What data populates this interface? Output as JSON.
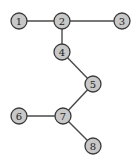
{
  "diagram": {
    "type": "tree-graph",
    "nodes": [
      {
        "id": "1",
        "label": "1",
        "x": 19,
        "y": 21
      },
      {
        "id": "2",
        "label": "2",
        "x": 62,
        "y": 21
      },
      {
        "id": "3",
        "label": "3",
        "x": 122,
        "y": 21
      },
      {
        "id": "4",
        "label": "4",
        "x": 62,
        "y": 52
      },
      {
        "id": "5",
        "label": "5",
        "x": 93,
        "y": 84
      },
      {
        "id": "6",
        "label": "6",
        "x": 19,
        "y": 116
      },
      {
        "id": "7",
        "label": "7",
        "x": 63,
        "y": 116
      },
      {
        "id": "8",
        "label": "8",
        "x": 93,
        "y": 146
      }
    ],
    "edges": [
      [
        "1",
        "2"
      ],
      [
        "2",
        "3"
      ],
      [
        "2",
        "4"
      ],
      [
        "4",
        "5"
      ],
      [
        "5",
        "7"
      ],
      [
        "6",
        "7"
      ],
      [
        "7",
        "8"
      ]
    ],
    "colors": {
      "node_fill": "#c8c8c8",
      "node_stroke": "#3a3a3a",
      "edge": "#4a4a4a"
    }
  }
}
